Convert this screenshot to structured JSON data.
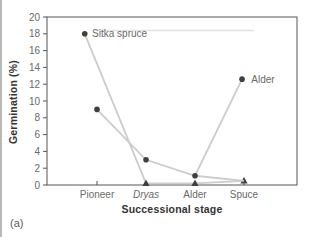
{
  "panel_label": "(a)",
  "chart_data": {
    "type": "line",
    "title": "",
    "xlabel": "Successional stage",
    "ylabel": "Germination (%)",
    "ylim": [
      0,
      20
    ],
    "ytick_step": 2,
    "grid": false,
    "legend_position": "inline-labels",
    "categories": [
      "Pioneer",
      "Dryas",
      "Alder",
      "Spuce"
    ],
    "italic_categories": [
      "Dryas"
    ],
    "colors": {
      "series_line": "#cccccc",
      "marker": "#404040",
      "axis": "#555555",
      "tick_label": "#6a6a6a",
      "series_label": "#6a6a6a",
      "artifact": "#e2e2e2"
    },
    "series": [
      {
        "name": "Sitka spruce",
        "values_at_stages": [
          18,
          0.2,
          0.2,
          0.5
        ],
        "points": [
          {
            "x": -0.25,
            "y": 18,
            "marker": "dot"
          },
          {
            "x": 1,
            "y": 0.2,
            "marker": "triangle"
          },
          {
            "x": 2,
            "y": 0.2,
            "marker": "triangle"
          },
          {
            "x": 3,
            "y": 0.5,
            "marker": "triangle"
          }
        ],
        "label": {
          "text": "Sitka spruce",
          "x": -0.1,
          "y": 18
        }
      },
      {
        "name": "Alder",
        "values_at_stages": [
          9,
          3,
          1.1,
          0.5
        ],
        "points": [
          {
            "x": 0,
            "y": 9,
            "marker": "dot"
          },
          {
            "x": 1,
            "y": 3,
            "marker": "dot"
          },
          {
            "x": 2,
            "y": 1.1,
            "marker": "dot"
          },
          {
            "x": 3,
            "y": 0.5,
            "marker": "none"
          }
        ],
        "leader": {
          "from": {
            "x": 2,
            "y": 1.1
          },
          "to": {
            "x": 2.96,
            "y": 12.6
          },
          "marker": "dot"
        },
        "label": {
          "text": "Alder",
          "x": 3.15,
          "y": 12.6
        }
      }
    ],
    "scan_artifact_line": {
      "x1": -0.05,
      "x2": 3.2,
      "y": 18.4
    }
  }
}
